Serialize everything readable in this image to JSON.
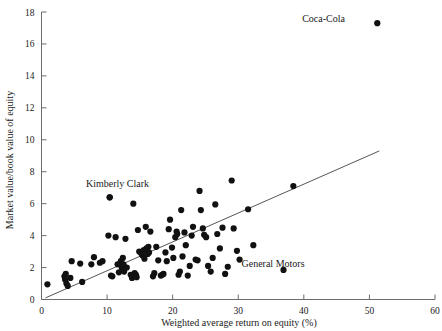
{
  "chart_data": {
    "type": "scatter",
    "title": "",
    "xlabel": "Weighted average return on equity (%)",
    "ylabel": "Market value/book value of equity",
    "xlim": [
      0,
      60
    ],
    "ylim": [
      0,
      18
    ],
    "xticks": [
      0,
      10,
      20,
      30,
      40,
      50,
      60
    ],
    "yticks": [
      0,
      2,
      4,
      6,
      8,
      10,
      12,
      14,
      16,
      18
    ],
    "xtick_labels": [
      "0",
      "10",
      "20",
      "30",
      "40",
      "50",
      "60"
    ],
    "ytick_labels": [
      "0",
      "2",
      "4",
      "6",
      "8",
      "10",
      "12",
      "14",
      "16",
      "18"
    ],
    "grid": false,
    "legend": "none",
    "marker": "filled-circle",
    "marker_color": "#111111",
    "trendline": {
      "label": "least-squares fit",
      "color": "#555555",
      "x_start": 0.6,
      "y_start": 0.1,
      "x_end": 51.5,
      "y_end": 9.3
    },
    "annotations": [
      {
        "text": "Coca-Cola",
        "label_x": 43.0,
        "label_y": 17.35,
        "point_x": 51.2,
        "point_y": 17.3
      },
      {
        "text": "Kimberly Clark",
        "label_x": 11.6,
        "label_y": 7.05,
        "point_x": 10.4,
        "point_y": 6.4
      },
      {
        "text": "General Motors",
        "label_x": 35.3,
        "label_y": 2.05,
        "point_x": 36.9,
        "point_y": 1.85
      }
    ],
    "points": [
      [
        0.9,
        0.95
      ],
      [
        3.5,
        1.45
      ],
      [
        3.6,
        1.25
      ],
      [
        3.7,
        1.6
      ],
      [
        3.8,
        1.0
      ],
      [
        4.0,
        0.85
      ],
      [
        4.4,
        1.35
      ],
      [
        4.6,
        2.4
      ],
      [
        5.9,
        2.25
      ],
      [
        6.2,
        1.1
      ],
      [
        7.6,
        2.2
      ],
      [
        8.0,
        2.65
      ],
      [
        8.9,
        2.3
      ],
      [
        9.3,
        2.4
      ],
      [
        10.2,
        4.0
      ],
      [
        10.4,
        6.4
      ],
      [
        10.6,
        1.5
      ],
      [
        10.8,
        1.45
      ],
      [
        11.3,
        3.9
      ],
      [
        11.6,
        2.2
      ],
      [
        11.8,
        1.7
      ],
      [
        12.0,
        2.25
      ],
      [
        12.1,
        2.4
      ],
      [
        12.2,
        2.05
      ],
      [
        12.3,
        1.95
      ],
      [
        12.4,
        2.6
      ],
      [
        12.5,
        2.2
      ],
      [
        12.6,
        1.75
      ],
      [
        12.8,
        3.8
      ],
      [
        13.0,
        2.0
      ],
      [
        13.6,
        1.55
      ],
      [
        13.8,
        1.35
      ],
      [
        14.0,
        6.0
      ],
      [
        14.2,
        1.65
      ],
      [
        14.4,
        1.55
      ],
      [
        14.5,
        1.4
      ],
      [
        14.7,
        4.35
      ],
      [
        14.9,
        3.0
      ],
      [
        15.2,
        2.9
      ],
      [
        15.4,
        2.75
      ],
      [
        15.6,
        3.1
      ],
      [
        15.7,
        2.55
      ],
      [
        15.9,
        4.55
      ],
      [
        16.0,
        3.2
      ],
      [
        16.1,
        3.05
      ],
      [
        16.2,
        2.85
      ],
      [
        16.3,
        3.3
      ],
      [
        16.4,
        2.95
      ],
      [
        16.6,
        4.25
      ],
      [
        17.0,
        1.45
      ],
      [
        17.2,
        1.65
      ],
      [
        17.5,
        3.3
      ],
      [
        17.8,
        2.45
      ],
      [
        18.2,
        1.5
      ],
      [
        18.4,
        1.55
      ],
      [
        18.6,
        1.6
      ],
      [
        18.9,
        2.95
      ],
      [
        19.1,
        2.4
      ],
      [
        19.4,
        4.4
      ],
      [
        19.6,
        5.0
      ],
      [
        19.9,
        3.25
      ],
      [
        20.1,
        2.6
      ],
      [
        20.4,
        3.9
      ],
      [
        20.6,
        4.25
      ],
      [
        20.7,
        4.1
      ],
      [
        20.9,
        1.55
      ],
      [
        21.1,
        1.75
      ],
      [
        21.3,
        5.6
      ],
      [
        21.5,
        2.7
      ],
      [
        21.8,
        4.2
      ],
      [
        22.0,
        3.4
      ],
      [
        22.3,
        1.5
      ],
      [
        22.6,
        2.1
      ],
      [
        22.9,
        4.0
      ],
      [
        23.1,
        4.55
      ],
      [
        23.5,
        2.5
      ],
      [
        23.8,
        2.45
      ],
      [
        24.1,
        6.8
      ],
      [
        24.3,
        5.6
      ],
      [
        24.6,
        4.45
      ],
      [
        24.8,
        4.05
      ],
      [
        25.1,
        3.9
      ],
      [
        25.4,
        2.1
      ],
      [
        25.8,
        1.75
      ],
      [
        26.1,
        2.6
      ],
      [
        26.5,
        5.95
      ],
      [
        26.8,
        4.1
      ],
      [
        27.2,
        3.2
      ],
      [
        27.6,
        4.5
      ],
      [
        28.0,
        1.6
      ],
      [
        28.4,
        2.05
      ],
      [
        29.0,
        7.45
      ],
      [
        29.3,
        4.45
      ],
      [
        29.8,
        3.05
      ],
      [
        30.2,
        2.5
      ],
      [
        31.5,
        5.65
      ],
      [
        32.3,
        3.4
      ],
      [
        38.4,
        7.1
      ]
    ]
  }
}
